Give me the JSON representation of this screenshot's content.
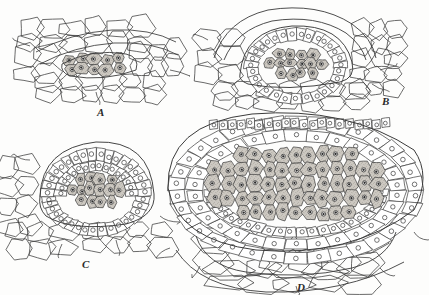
{
  "plate": {
    "title": "Stages in the development of a sporangium (anther) in transverse section",
    "background_color": "#fdfdfc",
    "line_color": "#3a3a3a",
    "shaded_cell_fill": "#cdc9c2",
    "plain_cell_fill": "#ffffff",
    "nucleus_color": "#2a2a2a",
    "stipple_color": "#8d8880"
  },
  "panels": [
    {
      "id": "A",
      "label": "A",
      "label_x": 97,
      "label_y": 106,
      "caption": "Earliest stage: a small lens-shaped group of archesporial cells embedded in ground tissue",
      "sporogenous_cell_count": 9,
      "wall_layer_count": 0,
      "outline": "lens",
      "center_x": 95,
      "center_y": 62,
      "width": 95,
      "height": 30
    },
    {
      "id": "B",
      "label": "B",
      "label_x": 382,
      "label_y": 95,
      "caption": "Archesporium enlarged and a single layer of wall cells differentiated around the sporogenous mass",
      "sporogenous_cell_count": 17,
      "wall_layer_count": 1,
      "outline": "dome",
      "center_x": 295,
      "center_y": 55,
      "width": 130,
      "height": 60
    },
    {
      "id": "C",
      "label": "C",
      "label_x": 82,
      "label_y": 258,
      "caption": "Sporangium hemispherical; sporogenous tissue surrounded by a distinct wall of one to two layers",
      "sporogenous_cell_count": 33,
      "wall_layer_count": 2,
      "outline": "dome",
      "center_x": 96,
      "center_y": 190,
      "width": 120,
      "height": 80
    },
    {
      "id": "D",
      "label": "D",
      "label_x": 297,
      "label_y": 281,
      "caption": "Mature sporangium: large central mass of sporogenous cells enclosed by several wall layers and subtended by stalk tissue",
      "sporogenous_cell_count": 84,
      "wall_layer_count": 3,
      "outline": "ellipse",
      "center_x": 295,
      "center_y": 190,
      "width": 250,
      "height": 135
    }
  ],
  "legend_terms": {
    "sporogenous_cell": "shaded cell with dense nucleus",
    "wall_cell": "unshaded cell with small circular nucleus",
    "ground_tissue": "large thin-walled parenchyma cells"
  }
}
